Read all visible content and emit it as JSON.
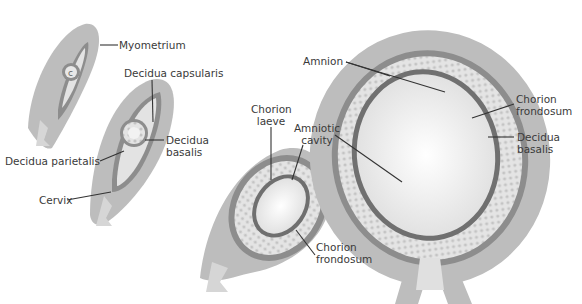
{
  "figure": {
    "stages": [
      "early implantation",
      "decidua capsularis stage",
      "chorion laeve stage",
      "late fetus"
    ],
    "colors": {
      "myometrium": "#b9b9b9",
      "decidua": "#8a8a8a",
      "cavity": "#e6e6e6",
      "villi": "#d0d0d0",
      "line": "#333333",
      "text": "#3a3a3a"
    }
  },
  "labels": {
    "myometrium": "Myometrium",
    "decidua_capsularis": "Decidua capsularis",
    "decidua_basalis_1_line1": "Decidua",
    "decidua_basalis_1_line2": "basalis",
    "decidua_parietalis": "Decidua parietalis",
    "cervix": "Cervix",
    "chorion_laeve_line1": "Chorion",
    "chorion_laeve_line2": "laeve",
    "amniotic_cavity_line1": "Amniotic",
    "amniotic_cavity_line2": "cavity",
    "chorion_frondosum_1_line1": "Chorion",
    "chorion_frondosum_1_line2": "frondosum",
    "amnion": "Amnion",
    "chorion_frondosum_2_line1": "Chorion",
    "chorion_frondosum_2_line2": "frondosum",
    "decidua_basalis_2_line1": "Decidua",
    "decidua_basalis_2_line2": "basalis"
  }
}
